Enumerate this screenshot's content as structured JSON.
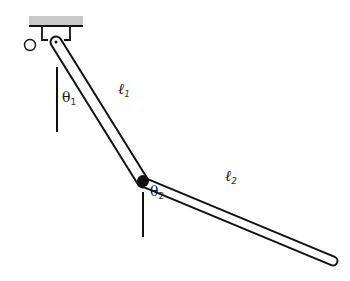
{
  "diagram": {
    "type": "double-pendulum",
    "origin_label": "O",
    "links": [
      {
        "name": "link-1",
        "length_label": "ℓ",
        "length_sub": "1",
        "angle_label": "θ",
        "angle_sub": "1"
      },
      {
        "name": "link-2",
        "length_label": "ℓ",
        "length_sub": "2",
        "angle_label": "θ",
        "angle_sub": "2"
      }
    ],
    "colors": {
      "ceiling": "#c8c8c8",
      "stroke": "#111111",
      "joint": "#111111"
    }
  }
}
